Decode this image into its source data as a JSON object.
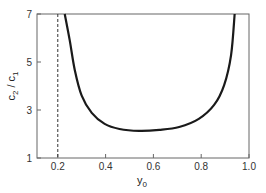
{
  "chart_data": {
    "type": "line",
    "title": "",
    "xlabel": "y0",
    "xlabel_main": "y",
    "xlabel_sub": "0",
    "ylabel": "c2 / c1",
    "ylabel_parts": {
      "a": "c",
      "a_sub": "2",
      "sep": " / ",
      "b": "c",
      "b_sub": "1"
    },
    "xlim": [
      0.113,
      1.0
    ],
    "ylim": [
      1,
      7
    ],
    "xticks": [
      0.2,
      0.4,
      0.6,
      0.8,
      1.0
    ],
    "xtick_labels": [
      "0.2",
      "0.4",
      "0.6",
      "0.8",
      "1.0"
    ],
    "yticks": [
      1,
      3,
      5,
      7
    ],
    "ytick_labels": [
      "1",
      "3",
      "5",
      "7"
    ],
    "grid": false,
    "series": [
      {
        "name": "c2/c1",
        "style": "solid",
        "x": [
          0.229,
          0.25,
          0.271,
          0.3,
          0.342,
          0.396,
          0.458,
          0.54,
          0.625,
          0.708,
          0.79,
          0.854,
          0.896,
          0.925,
          0.94
        ],
        "y": [
          7.0,
          5.9,
          4.67,
          3.6,
          2.88,
          2.42,
          2.21,
          2.13,
          2.17,
          2.29,
          2.63,
          3.21,
          4.04,
          5.29,
          7.0
        ]
      }
    ],
    "reference_lines": [
      {
        "name": "vertical-dashed",
        "x": 0.2,
        "style": "dashed"
      }
    ]
  }
}
